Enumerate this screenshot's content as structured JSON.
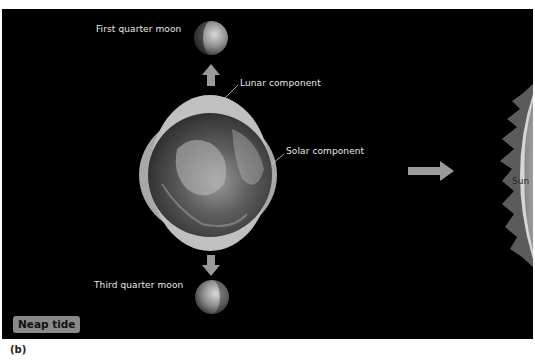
{
  "figure": {
    "panel_label": "(b)",
    "tide_badge": "Neap tide",
    "labels": {
      "first_quarter_moon": "First quarter moon",
      "third_quarter_moon": "Third quarter moon",
      "lunar_component": "Lunar component",
      "solar_component": "Solar component",
      "sun": "Sun"
    },
    "colors": {
      "background": "#000000",
      "bulge": "#b9b9b9",
      "arrow": "#9a9a9a",
      "badge": "#8a8a8a",
      "text": "#e8e8e8"
    }
  }
}
